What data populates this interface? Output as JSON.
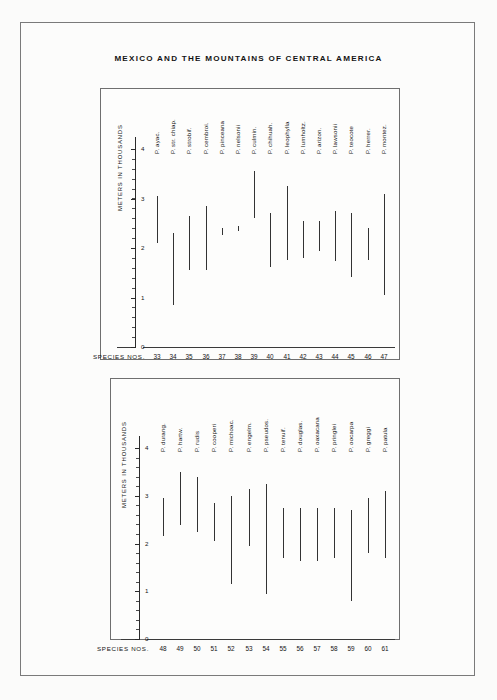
{
  "figure": {
    "title": "MEXICO AND THE MOUNTAINS OF CENTRAL AMERICA",
    "axis_title": "METERS IN THOUSANDS",
    "species_nos_label": "SPECIES  NOS."
  },
  "chart_data": [
    {
      "type": "bar",
      "orientation": "vertical-range",
      "title": "MEXICO AND THE MOUNTAINS OF CENTRAL AMERICA",
      "panel": "upper",
      "xlabel": "SPECIES  NOS.",
      "ylabel": "METERS IN THOUSANDS",
      "ylim": [
        0,
        4.3
      ],
      "yticks": [
        0,
        1,
        2,
        3,
        4
      ],
      "ytick_labels": [
        "0",
        "1",
        "2",
        "3",
        "4"
      ],
      "grid": false,
      "legend": "none",
      "categories": [
        "33",
        "34",
        "35",
        "36",
        "37",
        "38",
        "39",
        "40",
        "41",
        "42",
        "43",
        "44",
        "45",
        "46",
        "47"
      ],
      "species_labels": [
        "P. ayac.",
        "P. str. chiap.",
        "P. strobif.",
        "P. cembroi.",
        "P. pinceana",
        "P. nelsonii",
        "P. culmin.",
        "P. chihuah.",
        "P. leophylla",
        "P. lumholtz.",
        "P. arizon.",
        "P. lawsonii",
        "P. teocote",
        "P. herrer.",
        "P. montez."
      ],
      "series": [
        {
          "name": "elevation range low (thousands of meters)",
          "values": [
            2.1,
            0.85,
            1.55,
            1.55,
            2.25,
            2.35,
            2.6,
            1.6,
            1.75,
            1.8,
            1.95,
            1.75,
            1.4,
            1.75,
            1.05
          ]
        },
        {
          "name": "elevation range high (thousands of meters)",
          "values": [
            3.05,
            2.3,
            2.65,
            2.85,
            2.4,
            2.45,
            3.55,
            2.7,
            3.25,
            2.55,
            2.55,
            2.75,
            2.7,
            2.4,
            3.1
          ]
        }
      ]
    },
    {
      "type": "bar",
      "orientation": "vertical-range",
      "panel": "lower",
      "xlabel": "SPECIES  NOS.",
      "ylabel": "METERS IN THOUSANDS",
      "ylim": [
        0,
        4.3
      ],
      "yticks": [
        0,
        1,
        2,
        3,
        4
      ],
      "ytick_labels": [
        "0",
        "1",
        "2",
        "3",
        "4"
      ],
      "grid": false,
      "legend": "none",
      "categories": [
        "48",
        "49",
        "50",
        "51",
        "52",
        "53",
        "54",
        "55",
        "56",
        "57",
        "58",
        "59",
        "60",
        "61"
      ],
      "species_labels": [
        "P. durang.",
        "P. hartw.",
        "P. rudis",
        "P. cooperi",
        "P. michoac.",
        "P. engelm.",
        "P. pseudos.",
        "P. tenuif.",
        "P. douglas.",
        "P. oaxacana",
        "P. pringlei",
        "P. oocarpa",
        "P. greggi",
        "P. patula"
      ],
      "series": [
        {
          "name": "elevation range low (thousands of meters)",
          "values": [
            2.15,
            2.4,
            2.25,
            2.05,
            1.15,
            1.95,
            0.95,
            1.7,
            1.65,
            1.65,
            1.7,
            0.8,
            1.8,
            1.7
          ]
        },
        {
          "name": "elevation range high (thousands of meters)",
          "values": [
            2.95,
            3.5,
            3.4,
            2.85,
            3.0,
            3.15,
            3.25,
            2.75,
            2.75,
            2.75,
            2.75,
            2.7,
            2.95,
            3.1
          ]
        }
      ]
    }
  ]
}
